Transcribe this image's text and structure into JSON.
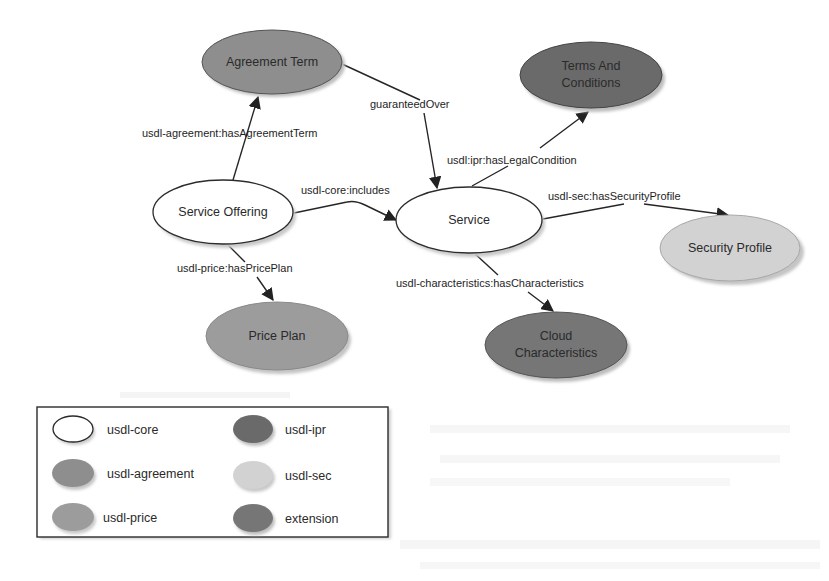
{
  "diagram": {
    "nodes": {
      "agreement_term": {
        "label": "Agreement Term",
        "category": "usdl-agreement"
      },
      "terms_and_conditions": {
        "label_line1": "Terms And",
        "label_line2": "Conditions",
        "category": "usdl-ipr"
      },
      "service_offering": {
        "label": "Service Offering",
        "category": "usdl-core"
      },
      "service": {
        "label": "Service",
        "category": "usdl-core"
      },
      "security_profile": {
        "label": "Security Profile",
        "category": "usdl-sec"
      },
      "price_plan": {
        "label": "Price Plan",
        "category": "usdl-price"
      },
      "cloud_characteristics": {
        "label_line1": "Cloud",
        "label_line2": "Characteristics",
        "category": "extension"
      }
    },
    "edges": {
      "has_agreement_term": {
        "label": "usdl-agreement:hasAgreementTerm",
        "from": "Service Offering",
        "to": "Agreement Term"
      },
      "guaranteed_over": {
        "label": "guaranteedOver",
        "from": "Agreement Term",
        "to": "Service"
      },
      "includes": {
        "label": "usdl-core:includes",
        "from": "Service Offering",
        "to": "Service"
      },
      "has_legal_condition": {
        "label": "usdl:ipr:hasLegalCondition",
        "from": "Service",
        "to": "Terms And Conditions"
      },
      "has_security_profile": {
        "label": "usdl-sec:hasSecurityProfile",
        "from": "Service",
        "to": "Security Profile"
      },
      "has_price_plan": {
        "label": "usdl-price:hasPricePlan",
        "from": "Service Offering",
        "to": "Price Plan"
      },
      "has_characteristics": {
        "label": "usdl-characteristics:hasCharacteristics",
        "from": "Service",
        "to": "Cloud Characteristics"
      }
    },
    "legend": {
      "items": [
        {
          "label": "usdl-core",
          "color": "#ffffff"
        },
        {
          "label": "usdl-ipr",
          "color": "#6a6a6a"
        },
        {
          "label": "usdl-agreement",
          "color": "#8e8e8e"
        },
        {
          "label": "usdl-sec",
          "color": "#d2d2d2"
        },
        {
          "label": "usdl-price",
          "color": "#9c9c9c"
        },
        {
          "label": "extension",
          "color": "#767676"
        }
      ]
    },
    "colors": {
      "usdl_core": "#ffffff",
      "usdl_agreement": "#8e8e8e",
      "usdl_ipr": "#6a6a6a",
      "usdl_sec": "#d2d2d2",
      "usdl_price": "#9c9c9c",
      "extension": "#767676",
      "stroke": "#2b2b2b",
      "shadow": "#bdbdbd"
    }
  }
}
